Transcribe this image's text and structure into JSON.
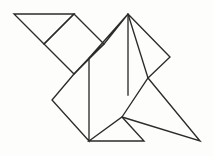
{
  "figure": {
    "canvas": {
      "width": 213,
      "height": 156
    },
    "style": {
      "stroke_color": "#2b2b2b",
      "fill_color": "none",
      "background_color": "#fdfdfc",
      "stroke_width": 1.35
    },
    "vertices": {
      "top_left": [
        14,
        14
      ],
      "diamond_top": [
        74,
        14
      ],
      "top_right": [
        128,
        14
      ],
      "diamond_left": [
        44,
        44
      ],
      "diamond_right": [
        104,
        44
      ],
      "right_point": [
        170,
        57
      ],
      "mid_vertical_top": [
        89,
        58
      ],
      "diamond_bottom": [
        74,
        74
      ],
      "right_mid_vertex": [
        148,
        78
      ],
      "left_point": [
        52,
        100
      ],
      "lower_triangle_apex": [
        122,
        117
      ],
      "bottom_left": [
        89,
        141
      ],
      "bottom_mid": [
        144,
        141
      ],
      "bottom_right": [
        200,
        141
      ]
    },
    "pieces": [
      {
        "name": "upper-left-triangle",
        "kind": "triangle",
        "points": "14,14 74,14 44,44"
      },
      {
        "name": "rotated-square-diamond",
        "kind": "square",
        "points": "74,14 104,44 74,74 44,44"
      },
      {
        "name": "upper-middle-triangle",
        "kind": "triangle",
        "points": "104,44 128,14 89,58"
      },
      {
        "name": "upper-right-triangle",
        "kind": "triangle",
        "points": "128,14 170,57 148,78"
      },
      {
        "name": "center-parallelogram",
        "kind": "parallelogram",
        "points": "74,74 89,58 89,141 52,100"
      },
      {
        "name": "right-large-triangle",
        "kind": "triangle",
        "points": "148,78 200,141 122,117"
      },
      {
        "name": "bottom-small-triangle",
        "kind": "triangle",
        "points": "89,141 122,117 144,141"
      }
    ],
    "edges": [
      {
        "name": "top-edge",
        "from": [
          14,
          14
        ],
        "to": [
          128,
          14
        ]
      },
      {
        "name": "upper-left-diagonal",
        "from": [
          14,
          14
        ],
        "to": [
          44,
          44
        ]
      },
      {
        "name": "diamond-upper-left",
        "from": [
          44,
          44
        ],
        "to": [
          74,
          14
        ]
      },
      {
        "name": "diamond-upper-right",
        "from": [
          74,
          14
        ],
        "to": [
          104,
          44
        ]
      },
      {
        "name": "diamond-lower-right",
        "from": [
          104,
          44
        ],
        "to": [
          74,
          74
        ]
      },
      {
        "name": "diamond-lower-left",
        "from": [
          74,
          74
        ],
        "to": [
          44,
          44
        ]
      },
      {
        "name": "left-lower-diagonal",
        "from": [
          74,
          74
        ],
        "to": [
          52,
          100
        ]
      },
      {
        "name": "left-point-to-bottom",
        "from": [
          52,
          100
        ],
        "to": [
          89,
          141
        ]
      },
      {
        "name": "center-vertical",
        "from": [
          89,
          58
        ],
        "to": [
          89,
          141
        ]
      },
      {
        "name": "mid-diagonal-up-right",
        "from": [
          89,
          58
        ],
        "to": [
          128,
          14
        ]
      },
      {
        "name": "right-upper-diagonal",
        "from": [
          128,
          14
        ],
        "to": [
          170,
          57
        ]
      },
      {
        "name": "right-point-inward",
        "from": [
          170,
          57
        ],
        "to": [
          148,
          78
        ]
      },
      {
        "name": "right-vertical-drop",
        "from": [
          128,
          14
        ],
        "to": [
          128,
          95
        ]
      },
      {
        "name": "right-triangle-hypotenuse",
        "from": [
          148,
          78
        ],
        "to": [
          200,
          141
        ]
      },
      {
        "name": "right-triangle-left-leg",
        "from": [
          148,
          78
        ],
        "to": [
          122,
          117
        ]
      },
      {
        "name": "bottom-edge",
        "from": [
          89,
          141
        ],
        "to": [
          200,
          141
        ]
      },
      {
        "name": "bottom-triangle-left",
        "from": [
          89,
          141
        ],
        "to": [
          122,
          117
        ]
      },
      {
        "name": "bottom-triangle-right",
        "from": [
          122,
          117
        ],
        "to": [
          144,
          141
        ]
      }
    ]
  }
}
